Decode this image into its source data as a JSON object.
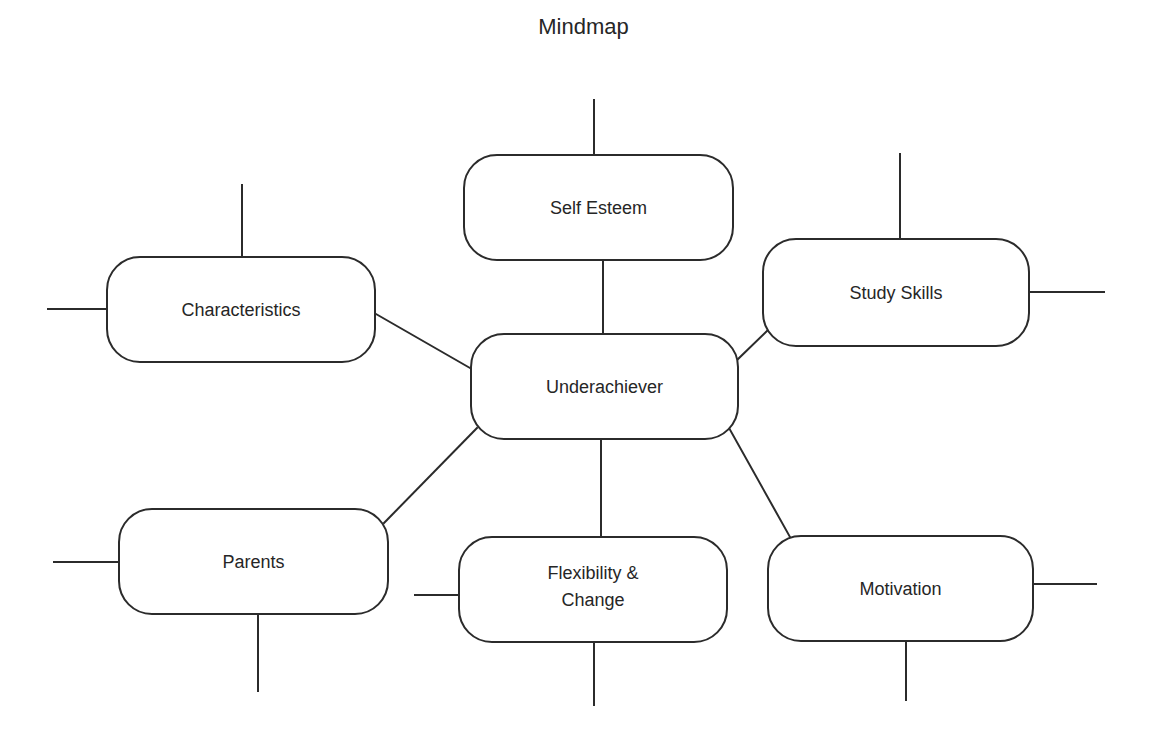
{
  "diagram": {
    "title": "Mindmap",
    "central_node": {
      "id": "underachiever",
      "label": "Underachiever"
    },
    "branches": [
      {
        "id": "self-esteem",
        "label": "Self Esteem"
      },
      {
        "id": "characteristics",
        "label": "Characteristics"
      },
      {
        "id": "study-skills",
        "label": "Study Skills"
      },
      {
        "id": "parents",
        "label": "Parents"
      },
      {
        "id": "flexibility-change",
        "label_line1": "Flexibility &",
        "label_line2": "Change"
      },
      {
        "id": "motivation",
        "label": "Motivation"
      }
    ],
    "colors": {
      "stroke": "#2b2b2b",
      "text": "#262626",
      "background": "#ffffff"
    }
  }
}
